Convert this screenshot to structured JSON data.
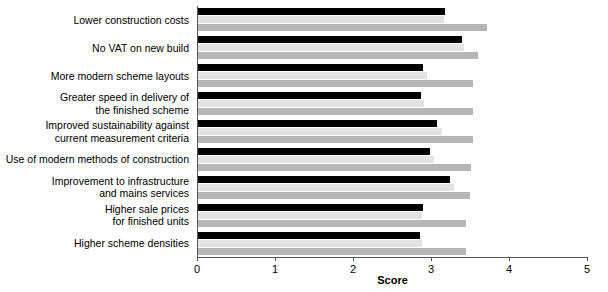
{
  "chart_data": {
    "type": "bar",
    "orientation": "horizontal",
    "title": "",
    "xlabel": "Score",
    "ylabel": "",
    "xlim": [
      0,
      5
    ],
    "xticks": [
      0,
      1,
      2,
      3,
      4,
      5
    ],
    "xtick_labels": [
      "0",
      "1",
      "2",
      "3",
      "4",
      "5"
    ],
    "grid": false,
    "legend": "none",
    "categories": [
      "Lower construction costs",
      "No VAT on new build",
      "More modern scheme layouts",
      "Greater speed in delivery of\nthe finished scheme",
      "Improved sustainability against\ncurrent measurement criteria",
      "Use of modern methods of construction",
      "Improvement to infrastructure\nand mains services",
      "Higher sale prices\nfor finished units",
      "Higher scheme densities"
    ],
    "series": [
      {
        "name": "series-1",
        "color": "#000000",
        "values": [
          3.17,
          3.39,
          2.89,
          2.86,
          3.06,
          2.98,
          3.23,
          2.89,
          2.85
        ]
      },
      {
        "name": "series-2",
        "color": "#e3e3e3",
        "values": [
          3.15,
          3.41,
          2.93,
          2.9,
          3.13,
          3.02,
          3.28,
          2.87,
          2.87
        ]
      },
      {
        "name": "series-3",
        "color": "#b6b6b6",
        "values": [
          3.7,
          3.59,
          3.53,
          3.53,
          3.53,
          3.5,
          3.49,
          3.43,
          3.44
        ]
      }
    ]
  }
}
